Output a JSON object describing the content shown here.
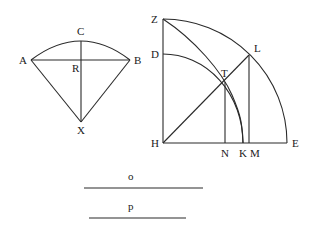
{
  "figure_left": {
    "labels": {
      "A": "A",
      "B": "B",
      "C": "C",
      "R": "R",
      "X": "X"
    },
    "points": {
      "A": [
        31,
        60
      ],
      "B": [
        130,
        60
      ],
      "C": [
        81,
        40
      ],
      "R": [
        81,
        60
      ],
      "X": [
        81,
        122
      ]
    }
  },
  "figure_right": {
    "labels": {
      "Z": "Z",
      "D": "D",
      "H": "H",
      "E": "E",
      "L": "L",
      "T": "T",
      "N": "N",
      "K": "K",
      "M": "M"
    },
    "points": {
      "Z": [
        163,
        19
      ],
      "D": [
        163,
        54
      ],
      "H": [
        163,
        143
      ],
      "E": [
        287,
        143
      ],
      "L": [
        249,
        55
      ],
      "T": [
        225,
        82
      ],
      "N": [
        225,
        143
      ],
      "K": [
        243,
        143
      ],
      "M": [
        249,
        143
      ]
    }
  },
  "segments": {
    "o": {
      "label": "o",
      "x1": 84,
      "x2": 203,
      "y": 188
    },
    "p": {
      "label": "p",
      "x1": 89,
      "x2": 186,
      "y": 218
    }
  },
  "colors": {
    "stroke": "#2a2a2a",
    "background": "#ffffff"
  }
}
